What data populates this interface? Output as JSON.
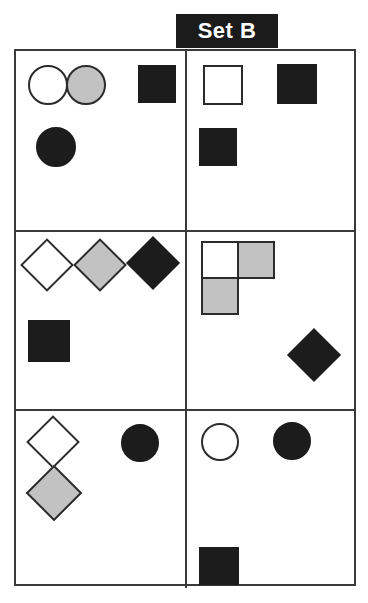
{
  "banner": {
    "label": "Set B",
    "background_color": "#1b1b1b",
    "text_color": "#ffffff"
  },
  "matrix": {
    "columns": 2,
    "rows": 3,
    "border_color": "#3a3a3a",
    "background_color": "#ffffff"
  },
  "palette": {
    "white": "#ffffff",
    "gray": "#c2c2c2",
    "black": "#1c1c1c",
    "outline": "#2b2b2b"
  },
  "cells": [
    {
      "id": "cell-1-left",
      "row": 1,
      "column": "left",
      "shape_count": 4,
      "shapes": [
        {
          "name": "circle-white",
          "type": "circle",
          "fill": "white",
          "size": 38
        },
        {
          "name": "circle-gray",
          "type": "circle",
          "fill": "gray",
          "size": 38
        },
        {
          "name": "square-black",
          "type": "square",
          "fill": "black",
          "size": 38
        },
        {
          "name": "circle-black",
          "type": "circle",
          "fill": "black",
          "size": 38
        }
      ]
    },
    {
      "id": "cell-1-right",
      "row": 1,
      "column": "right",
      "shape_count": 3,
      "shapes": [
        {
          "name": "square-white",
          "type": "square",
          "fill": "white",
          "size": 38
        },
        {
          "name": "square-black-upper",
          "type": "square",
          "fill": "black",
          "size": 38
        },
        {
          "name": "square-black-lower",
          "type": "square",
          "fill": "black",
          "size": 38
        }
      ]
    },
    {
      "id": "cell-2-left",
      "row": 2,
      "column": "left",
      "shape_count": 4,
      "shapes": [
        {
          "name": "diamond-white",
          "type": "diamond",
          "fill": "white",
          "size": 38
        },
        {
          "name": "diamond-gray",
          "type": "diamond",
          "fill": "gray",
          "size": 38
        },
        {
          "name": "diamond-black",
          "type": "diamond",
          "fill": "black",
          "size": 38
        },
        {
          "name": "square-black",
          "type": "square",
          "fill": "black",
          "size": 38
        }
      ]
    },
    {
      "id": "cell-2-right",
      "row": 2,
      "column": "right",
      "shape_count": 4,
      "shapes": [
        {
          "name": "square-white-top-left",
          "type": "square",
          "fill": "white",
          "size": 38
        },
        {
          "name": "square-gray-top-right",
          "type": "square",
          "fill": "gray",
          "size": 38
        },
        {
          "name": "square-gray-bottom-left",
          "type": "square",
          "fill": "gray",
          "size": 38
        },
        {
          "name": "diamond-black",
          "type": "diamond",
          "fill": "black",
          "size": 38
        }
      ]
    },
    {
      "id": "cell-3-left",
      "row": 3,
      "column": "left",
      "shape_count": 3,
      "shapes": [
        {
          "name": "diamond-white",
          "type": "diamond",
          "fill": "white",
          "size": 38
        },
        {
          "name": "diamond-gray",
          "type": "diamond",
          "fill": "gray",
          "size": 38
        },
        {
          "name": "circle-black",
          "type": "circle",
          "fill": "black",
          "size": 38
        }
      ]
    },
    {
      "id": "cell-3-right",
      "row": 3,
      "column": "right",
      "shape_count": 3,
      "shapes": [
        {
          "name": "circle-white",
          "type": "circle",
          "fill": "white",
          "size": 38
        },
        {
          "name": "circle-black",
          "type": "circle",
          "fill": "black",
          "size": 38
        },
        {
          "name": "square-black",
          "type": "square",
          "fill": "black",
          "size": 38
        }
      ]
    }
  ]
}
